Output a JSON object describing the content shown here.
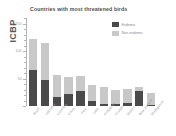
{
  "chart_data": {
    "type": "bar",
    "title": "Countries with most threatened birds",
    "ylabel": "ICBP",
    "xlabel": "",
    "grid": false,
    "stacked": true,
    "legend_position": "top-right",
    "ylim": [
      0,
      160
    ],
    "yticks": [
      0,
      50,
      100,
      150
    ],
    "ytick_labels": [
      "0",
      "50",
      "100",
      "150"
    ],
    "categories": [
      "Brazil",
      "Indonesia",
      "Colombia",
      "China",
      "Peru",
      "India",
      "Philippines",
      "Ecuador",
      "Mexico",
      "New Zealand",
      "Madagascar"
    ],
    "series": [
      {
        "name": "Endemic",
        "color": "#4a4a4a",
        "values": [
          66,
          48,
          17,
          22,
          27,
          10,
          3,
          3,
          6,
          28,
          2
        ]
      },
      {
        "name": "Non-endemic",
        "color": "#c8c8c8",
        "values": [
          56,
          67,
          39,
          30,
          28,
          28,
          31,
          27,
          25,
          6,
          22
        ]
      }
    ],
    "totals": [
      122,
      115,
      56,
      52,
      55,
      38,
      34,
      30,
      31,
      34,
      24
    ]
  },
  "legend": {
    "items": [
      {
        "label": "Endemic",
        "color": "#4a4a4a"
      },
      {
        "label": "Non-endemic",
        "color": "#c8c8c8"
      }
    ]
  },
  "colors": {
    "endemic": "#4a4a4a",
    "non_endemic": "#c8c8c8",
    "axis": "#b4b4b4",
    "title_text": "#4d4d4d",
    "tick_text": "#9a9a9a",
    "background": "#ffffff"
  }
}
